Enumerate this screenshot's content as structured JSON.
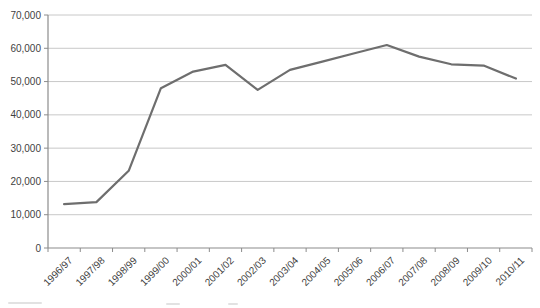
{
  "chart_data": {
    "type": "line",
    "title": "",
    "xlabel": "",
    "ylabel": "",
    "categories": [
      "1996/97",
      "1997/98",
      "1998/99",
      "1999/00",
      "2000/01",
      "2001/02",
      "2002/03",
      "2003/04",
      "2004/05",
      "2005/06",
      "2006/07",
      "2007/08",
      "2008/09",
      "2009/10",
      "2010/11"
    ],
    "series": [
      {
        "name": "series-1",
        "values": [
          13200,
          13800,
          23200,
          48000,
          53000,
          55000,
          47500,
          53500,
          56000,
          58500,
          61000,
          57500,
          55200,
          54800,
          50900
        ]
      }
    ],
    "ylim": [
      0,
      70000
    ],
    "y_tick_step": 10000,
    "y_tick_labels": [
      "0",
      "10,000",
      "20,000",
      "30,000",
      "40,000",
      "50,000",
      "60,000",
      "70,000"
    ],
    "grid": true,
    "legend": "none",
    "colors": {
      "line": "#6e6e6e",
      "gridline": "#c8c8c8",
      "axis": "#8c8c8c",
      "text": "#3f3f3f",
      "background": "#ffffff"
    }
  }
}
